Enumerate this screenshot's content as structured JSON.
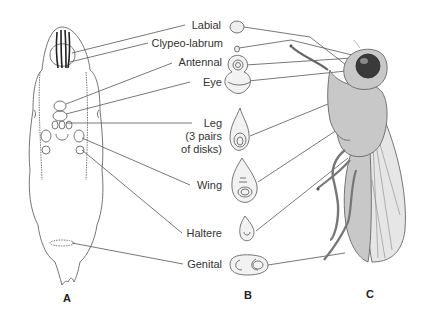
{
  "figure": {
    "panels": [
      {
        "id": "A",
        "label": "A",
        "subject": "larva"
      },
      {
        "id": "B",
        "label": "B",
        "subject": "imaginal-disks"
      },
      {
        "id": "C",
        "label": "C",
        "subject": "adult-fly"
      }
    ],
    "labels": [
      {
        "key": "labial",
        "text": "Labial"
      },
      {
        "key": "clypeo_labrum",
        "text": "Clypeo-labrum"
      },
      {
        "key": "antennal",
        "text": "Antennal"
      },
      {
        "key": "eye",
        "text": "Eye"
      },
      {
        "key": "leg",
        "text": "Leg"
      },
      {
        "key": "leg_note1",
        "text": "(3 pairs"
      },
      {
        "key": "leg_note2",
        "text": "of disks)"
      },
      {
        "key": "wing",
        "text": "Wing"
      },
      {
        "key": "haltere",
        "text": "Haltere"
      },
      {
        "key": "genital",
        "text": "Genital"
      }
    ],
    "colors": {
      "line": "#555555",
      "outline": "#666666",
      "fly_body": "#c8c8c8",
      "wing": "#e6e6e6",
      "eye": "#3a3a3a",
      "disk_fill": "#f2f2f2"
    }
  }
}
